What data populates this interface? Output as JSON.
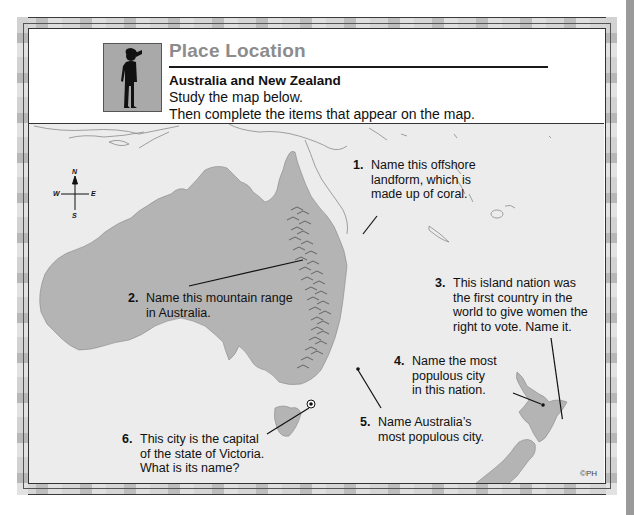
{
  "header": {
    "title": "Place Location",
    "subtitle": "Australia and New Zealand",
    "instructions": [
      "Study the map below.",
      "Then complete the items that appear on the map."
    ],
    "figure_icon": "person-looking-icon"
  },
  "map": {
    "compass": {
      "n": "N",
      "s": "S",
      "e": "E",
      "w": "W"
    },
    "colors": {
      "land": "#b4b4b4",
      "sea": "#ececec",
      "title": "#8c8c8c"
    },
    "questions": [
      {
        "num": "1.",
        "lines": [
          "Name this offshore",
          "landform, which is",
          "made up of coral."
        ]
      },
      {
        "num": "2.",
        "lines": [
          "Name this mountain range",
          "in Australia."
        ]
      },
      {
        "num": "3.",
        "lines": [
          "This island nation was",
          "the first country in the",
          "world to give women the",
          "right to vote.  Name it."
        ]
      },
      {
        "num": "4.",
        "lines": [
          "Name the most",
          "populous city",
          "in this nation."
        ]
      },
      {
        "num": "5.",
        "lines": [
          "Name Australia’s",
          "most populous city."
        ]
      },
      {
        "num": "6.",
        "lines": [
          "This city is the capital",
          "of the state of Victoria.",
          "What is its name?"
        ]
      }
    ],
    "copyright": "©PH"
  }
}
